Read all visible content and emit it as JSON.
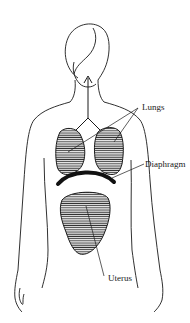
{
  "diagram": {
    "type": "anatomical illustration",
    "labels": {
      "lungs": "Lungs",
      "diaphragm": "Diaphragm",
      "uterus": "Uterus"
    },
    "colors": {
      "line": "#1a1a1a",
      "background": "#ffffff",
      "organ_fill": "#8a8a8a"
    }
  }
}
